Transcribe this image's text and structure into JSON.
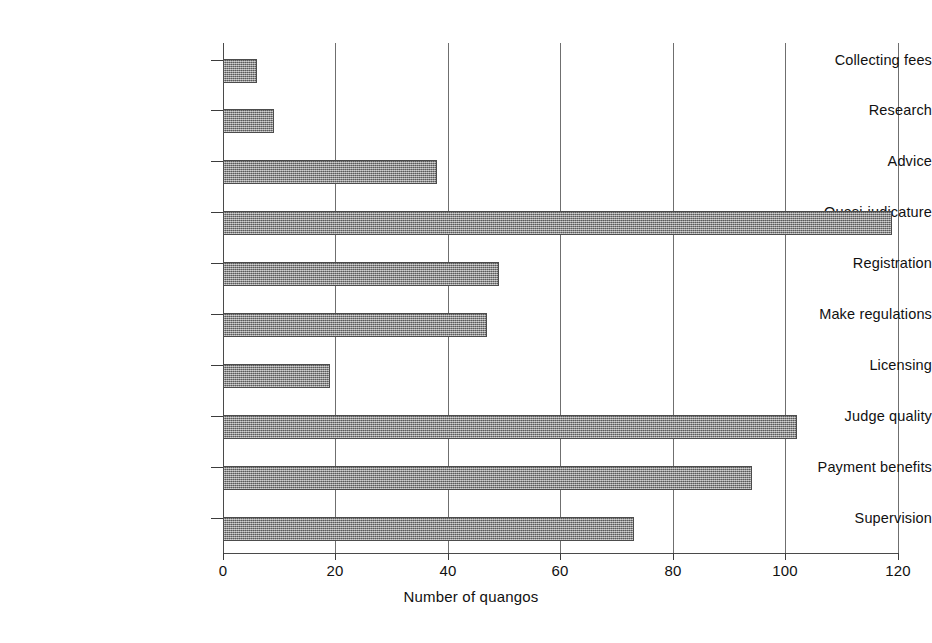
{
  "chart_data": {
    "type": "bar",
    "orientation": "horizontal",
    "title": "",
    "subtitle": "",
    "xlabel": "Number of quangos",
    "ylabel": "",
    "xlim": [
      0,
      120
    ],
    "ylim": null,
    "xticks": [
      0,
      20,
      40,
      60,
      80,
      100,
      120
    ],
    "xticklabels": [
      "0",
      "20",
      "40",
      "60",
      "80",
      "100",
      "120"
    ],
    "grid": "vertical gridlines at every x tick",
    "legend": "none",
    "categories": [
      "Collecting fees",
      "Research",
      "Advice",
      "Quasi-judicature",
      "Registration",
      "Make regulations",
      "Licensing",
      "Judge quality",
      "Payment benefits",
      "Supervision"
    ],
    "values": [
      6,
      9,
      38,
      119,
      49,
      47,
      19,
      102,
      94,
      73
    ],
    "series": [
      {
        "name": "Number of quangos",
        "values": [
          6,
          9,
          38,
          119,
          49,
          47,
          19,
          102,
          94,
          73
        ]
      }
    ],
    "bar_fill": "#8d8d8d",
    "bar_border": "#4c4c4c",
    "axis_color": "#3c3c3c",
    "grid_color": "#6f6f6f",
    "background": "#ffffff"
  }
}
